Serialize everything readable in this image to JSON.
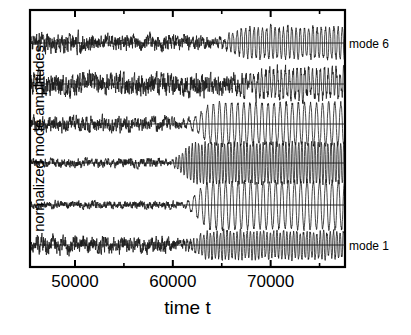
{
  "figure": {
    "background": "#ffffff",
    "line_color": "#1a1a1a",
    "axis_color": "#000000"
  },
  "axes": {
    "x_label": "time t",
    "y_label": "normalized mode amplitudes",
    "x_tick_labels": [
      "50000",
      "60000",
      "70000"
    ],
    "x_tick_values": [
      50000,
      60000,
      70000
    ],
    "x_minor_tick_values": [
      45000,
      55000,
      65000,
      75000
    ],
    "x_range": [
      45400,
      77600
    ],
    "frame": {
      "left": 30,
      "top": 10,
      "right": 345,
      "bottom": 267
    }
  },
  "annotations": [
    {
      "name": "mode-6-label",
      "text": "mode 6",
      "x": 349,
      "y": 37
    },
    {
      "name": "mode-1-label",
      "text": "mode 1",
      "x": 349,
      "y": 239
    }
  ],
  "chart_data": {
    "type": "line",
    "title": "",
    "xlabel": "time t",
    "ylabel": "normalized mode amplitudes",
    "xlim": [
      45400,
      77600
    ],
    "grid": false,
    "legend": "inline-right",
    "baselines_px": [
      43,
      84,
      124,
      163,
      205,
      245
    ],
    "series": [
      {
        "name": "mode 6",
        "label": "mode 6",
        "baseline_px": 43,
        "seed": 61,
        "noise_amp": 9.0,
        "osc_amp_start": 1.5,
        "osc_amp_end": 15.0,
        "onset_t": 62000,
        "full_t": 68000,
        "period_t": 430,
        "noise_decay_t": 66000,
        "noise_tail": 0.35,
        "spiky": 0.75,
        "pre_break_t": 52000,
        "pre_amp": 11.0
      },
      {
        "name": "mode 5",
        "label": "",
        "baseline_px": 84,
        "seed": 52,
        "noise_amp": 13.0,
        "osc_amp_start": 2.0,
        "osc_amp_end": 13.0,
        "onset_t": 63500,
        "full_t": 70000,
        "period_t": 400,
        "noise_decay_t": 70000,
        "noise_tail": 0.55,
        "spiky": 0.55,
        "pre_break_t": 47000,
        "pre_amp": 13.0
      },
      {
        "name": "mode 4",
        "label": "",
        "baseline_px": 124,
        "seed": 43,
        "noise_amp": 8.0,
        "osc_amp_start": 3.0,
        "osc_amp_end": 21.0,
        "onset_t": 59500,
        "full_t": 64500,
        "period_t": 620,
        "noise_decay_t": 63000,
        "noise_tail": 0.12,
        "spiky": 0.35,
        "pre_break_t": 56000,
        "pre_amp": 9.0
      },
      {
        "name": "mode 3",
        "label": "",
        "baseline_px": 163,
        "seed": 34,
        "noise_amp": 5.5,
        "osc_amp_start": 2.0,
        "osc_amp_end": 20.0,
        "onset_t": 58200,
        "full_t": 62500,
        "period_t": 330,
        "noise_decay_t": 61000,
        "noise_tail": 0.1,
        "spiky": 0.6,
        "pre_break_t": 57000,
        "pre_amp": 5.0
      },
      {
        "name": "mode 2",
        "label": "",
        "baseline_px": 205,
        "seed": 25,
        "noise_amp": 4.5,
        "osc_amp_start": 2.5,
        "osc_amp_end": 24.0,
        "onset_t": 59800,
        "full_t": 64000,
        "period_t": 640,
        "noise_decay_t": 62500,
        "noise_tail": 0.08,
        "spiky": 0.3,
        "pre_break_t": 58000,
        "pre_amp": 4.5
      },
      {
        "name": "mode 1",
        "label": "mode 1",
        "baseline_px": 245,
        "seed": 16,
        "noise_amp": 9.0,
        "osc_amp_start": 2.0,
        "osc_amp_end": 13.0,
        "onset_t": 59000,
        "full_t": 64000,
        "period_t": 340,
        "noise_decay_t": 63000,
        "noise_tail": 0.3,
        "spiky": 0.65,
        "pre_break_t": 53500,
        "pre_amp": 10.0
      }
    ]
  }
}
